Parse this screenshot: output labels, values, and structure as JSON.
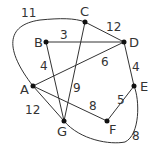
{
  "diagram": {
    "type": "weighted-graph",
    "vertices": [
      {
        "id": "A",
        "label": "A",
        "x": 33,
        "y": 86
      },
      {
        "id": "B",
        "label": "B",
        "x": 46,
        "y": 42
      },
      {
        "id": "C",
        "label": "C",
        "x": 85,
        "y": 22
      },
      {
        "id": "D",
        "label": "D",
        "x": 124,
        "y": 42
      },
      {
        "id": "E",
        "label": "E",
        "x": 134,
        "y": 86
      },
      {
        "id": "F",
        "label": "F",
        "x": 107,
        "y": 121
      },
      {
        "id": "G",
        "label": "G",
        "x": 64,
        "y": 121
      }
    ],
    "edges": [
      {
        "from": "A",
        "to": "C",
        "weight": "11",
        "curved": true
      },
      {
        "from": "B",
        "to": "D",
        "weight": "3"
      },
      {
        "from": "C",
        "to": "D",
        "weight": "12"
      },
      {
        "from": "B",
        "to": "G",
        "weight": "4"
      },
      {
        "from": "A",
        "to": "D",
        "weight": "6"
      },
      {
        "from": "C",
        "to": "G",
        "weight": "9"
      },
      {
        "from": "A",
        "to": "G",
        "weight": "12"
      },
      {
        "from": "A",
        "to": "F",
        "weight": "8"
      },
      {
        "from": "D",
        "to": "E",
        "weight": "4"
      },
      {
        "from": "E",
        "to": "F",
        "weight": "5"
      },
      {
        "from": "G",
        "to": "E",
        "weight": "8",
        "curved": true
      }
    ]
  }
}
